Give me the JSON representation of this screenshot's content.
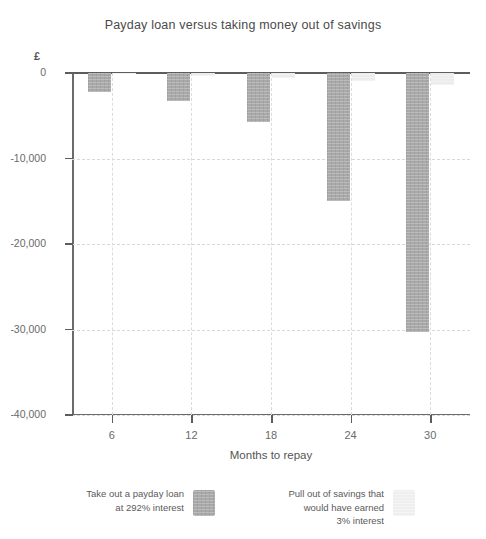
{
  "chart_data": {
    "type": "bar",
    "title": "Payday loan versus taking money out of savings",
    "xlabel": "Months to repay",
    "ylabel": "£",
    "categories": [
      "6",
      "12",
      "18",
      "24",
      "30"
    ],
    "series": [
      {
        "name": "Take out a payday loan\nat 292% interest",
        "color": "#a9a9a9",
        "values": [
          -2200,
          -3300,
          -5700,
          -15000,
          -30300
        ]
      },
      {
        "name": "Pull out of savings that\nwould have earned\n3% interest",
        "color": "#ececec",
        "values": [
          -150,
          -350,
          -600,
          -950,
          -1400
        ]
      }
    ],
    "ylim": [
      -40000,
      0
    ],
    "yticks": [
      0,
      -10000,
      -20000,
      -30000,
      -40000
    ],
    "ytick_labels": [
      "0",
      "-10,000",
      "-20,000",
      "-30,000",
      "-40,000"
    ],
    "grid": true,
    "legend_position": "bottom"
  },
  "legend": {
    "entries": [
      {
        "label": "Take out a payday loan\nat 292% interest",
        "swatch": "dark"
      },
      {
        "label": "Pull out of savings that\nwould have earned\n3% interest",
        "swatch": "light"
      }
    ]
  },
  "colors": {
    "bar_loan": "#a9a9a9",
    "bar_savings": "#ececec",
    "axis": "#5d5d5d",
    "grid": "#d8d8d8",
    "text": "#5a5a5a"
  }
}
